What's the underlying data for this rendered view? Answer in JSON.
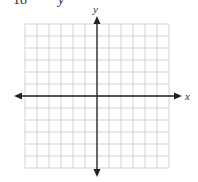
{
  "problem": {
    "number": "18",
    "variable": "y"
  },
  "graph": {
    "x_label": "x",
    "y_label": "y",
    "grid": {
      "columns": 12,
      "rows": 12,
      "left": 25,
      "top": 24,
      "cell": 12
    },
    "origin": {
      "x": 97,
      "y": 96
    },
    "colors": {
      "grid": "#c8c8c8",
      "axis": "#222222",
      "background": "#ffffff"
    }
  },
  "chart_data": {
    "type": "scatter",
    "title": "",
    "xlabel": "x",
    "ylabel": "y",
    "grid": true,
    "xlim": [
      -6,
      6
    ],
    "ylim": [
      -6,
      6
    ],
    "series": []
  }
}
